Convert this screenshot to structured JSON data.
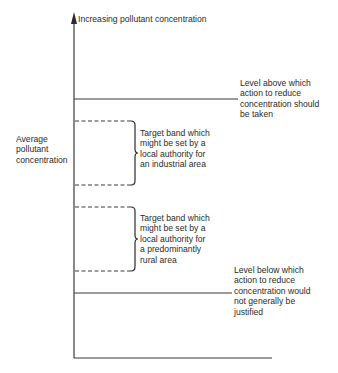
{
  "diagram": {
    "y_axis_title": "Increasing pollutant concentration",
    "y_label": "Average\npollutant\nconcentration",
    "upper_threshold": {
      "label": "Level above which\naction to reduce\nconcentration should\nbe taken",
      "line_style": "solid"
    },
    "industrial_band": {
      "label": "Target band which\nmight be set by a\nlocal authority for\nan industrial area",
      "line_style": "dashed"
    },
    "rural_band": {
      "label": "Target band which\nmight be set by a\nlocal authority for\na predominantly\nrural area",
      "line_style": "dashed"
    },
    "lower_threshold": {
      "label": "Level below which\naction to reduce\nconcentration would\nnot generally be\njustified",
      "line_style": "solid"
    },
    "colors": {
      "line": "#3a3a3a",
      "text": "#2a2a2a",
      "background": "#ffffff"
    }
  }
}
